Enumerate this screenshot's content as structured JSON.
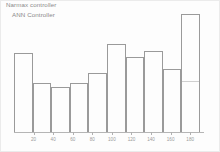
{
  "legend": {
    "series": [
      {
        "label": "Narmax controller"
      },
      {
        "label": "ANN Controller"
      }
    ]
  },
  "colors": {
    "bar_stroke": "#9a9a9a",
    "bar_stroke_faded": "#cfcfcf",
    "axis": "#b5b5b5",
    "text": "#8b8b8b",
    "background": "#fdfdfd"
  },
  "chart_data": {
    "type": "bar",
    "title": "",
    "subtitle": "",
    "xlabel": "",
    "ylabel": "",
    "grid": false,
    "legend_position": "top-left",
    "legend_entries": [
      "Narmax controller",
      "ANN Controller"
    ],
    "xlim": [
      0,
      190
    ],
    "ylim": [
      0,
      100
    ],
    "xticks": [
      20,
      40,
      60,
      80,
      100,
      120,
      140,
      160,
      180
    ],
    "xtick_labels": [
      "20",
      "40",
      "60",
      "80",
      "100",
      "120",
      "140",
      "160",
      "180"
    ],
    "bin_edges": [
      0,
      19,
      38,
      57,
      76,
      95,
      114,
      133,
      152,
      171,
      190
    ],
    "categories": [
      "0-19",
      "19-38",
      "38-57",
      "57-76",
      "76-95",
      "95-114",
      "114-133",
      "133-152",
      "152-171",
      "171-190"
    ],
    "values": [
      64,
      40,
      37,
      40,
      48,
      71,
      61,
      66,
      51,
      95
    ],
    "values_faded": [
      0,
      0,
      0,
      0,
      0,
      0,
      0,
      0,
      0,
      42
    ]
  }
}
